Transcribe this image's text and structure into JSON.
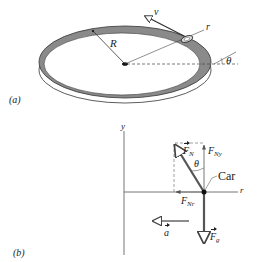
{
  "part_a": {
    "label": "(a)",
    "radius_label": "R",
    "velocity_label": "v",
    "radial_label": "r",
    "angle_label": "θ"
  },
  "part_b": {
    "label": "(b)",
    "y_axis_label": "y",
    "r_axis_label": "r",
    "normal_force": {
      "symbol": "F",
      "sub": "N"
    },
    "normal_y": {
      "symbol": "F",
      "sub": "Ny"
    },
    "normal_r": {
      "symbol": "F",
      "sub": "Nr"
    },
    "gravity": {
      "symbol": "F",
      "sub": "g"
    },
    "acceleration": {
      "symbol": "a"
    },
    "angle_label": "θ",
    "car_label": "Car"
  },
  "colors": {
    "ink": "#222222",
    "banking": "#8a8a8a",
    "vector": "#555555",
    "dashed": "#888888"
  }
}
